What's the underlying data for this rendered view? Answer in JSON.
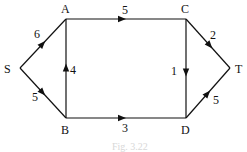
{
  "graph": {
    "nodes": [
      {
        "id": "S",
        "label": "S"
      },
      {
        "id": "A",
        "label": "A"
      },
      {
        "id": "B",
        "label": "B"
      },
      {
        "id": "C",
        "label": "C"
      },
      {
        "id": "D",
        "label": "D"
      },
      {
        "id": "T",
        "label": "T"
      }
    ],
    "edges": [
      {
        "from": "S",
        "to": "A",
        "weight": "6"
      },
      {
        "from": "S",
        "to": "B",
        "weight": "5"
      },
      {
        "from": "B",
        "to": "A",
        "weight": "4"
      },
      {
        "from": "A",
        "to": "C",
        "weight": "5"
      },
      {
        "from": "B",
        "to": "D",
        "weight": "3"
      },
      {
        "from": "C",
        "to": "D",
        "weight": "1"
      },
      {
        "from": "C",
        "to": "T",
        "weight": "2"
      },
      {
        "from": "D",
        "to": "T",
        "weight": "5"
      }
    ]
  },
  "caption": "Fig. 3.22"
}
